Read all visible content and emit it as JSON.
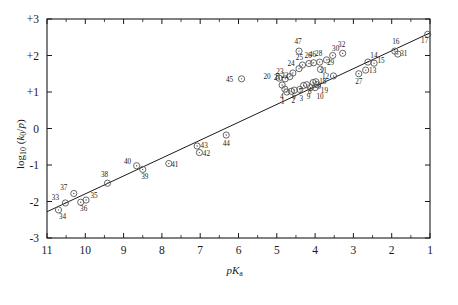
{
  "figure": {
    "background": "#ffffff",
    "ink": "#1a1a1a",
    "marker_color": "#555555"
  },
  "chart_data": {
    "type": "scatter",
    "title": "",
    "subtitle": "",
    "xlabel": "pKa",
    "xlabel_parts": {
      "p": "p",
      "K": "K",
      "sub": "a"
    },
    "ylabel": "log10 (k0/p)",
    "ylabel_parts": {
      "log": "log",
      "logsub": "10",
      "open": " (",
      "k": "k",
      "ksub": "0",
      "slash": "/",
      "p": "p",
      "close": ")"
    },
    "xlim": [
      11,
      1
    ],
    "ylim": [
      -3,
      3
    ],
    "x_reversed": true,
    "grid": false,
    "legend": null,
    "xticks": [
      11,
      10,
      9,
      8,
      7,
      6,
      5,
      4,
      3,
      2,
      1
    ],
    "xticklabels": [
      "11",
      "10",
      "9",
      "8",
      "7",
      "6",
      "5",
      "4",
      "3",
      "2",
      "1"
    ],
    "x_minor_ticks": [
      10.5,
      9.5,
      8.5,
      7.5,
      6.5,
      5.5,
      4.5,
      3.5,
      2.5,
      1.5
    ],
    "yticks": [
      3,
      2,
      1,
      0,
      -1,
      -2,
      -3
    ],
    "yticklabels": [
      "+3",
      "+2",
      "+1",
      "0",
      "-1",
      "-2",
      "-3"
    ],
    "ticks_all_sides": true,
    "fit_line": {
      "label": "",
      "x_start": 11.0,
      "y_start": -2.28,
      "x_end": 1.0,
      "y_end": 2.62,
      "slope": -0.49,
      "intercept": 3.11
    },
    "marker": {
      "shape": "circle-open-with-dot",
      "radius_px": 3.1
    },
    "points": [
      {
        "id": "1",
        "x": 4.74,
        "y": 1.0,
        "lx": -4,
        "ly": 12
      },
      {
        "id": "2",
        "x": 4.62,
        "y": 1.02,
        "lx": 2,
        "ly": 12
      },
      {
        "id": "3",
        "x": 4.54,
        "y": 1.05,
        "lx": 7,
        "ly": 11
      },
      {
        "id": "4",
        "x": 4.79,
        "y": 1.08,
        "lx": -3,
        "ly": 10
      },
      {
        "id": "5",
        "x": 4.86,
        "y": 1.19,
        "lx": -5,
        "ly": -6
      },
      {
        "id": "6",
        "x": 4.4,
        "y": 1.07,
        "lx": -6,
        "ly": 10
      },
      {
        "id": "7",
        "x": 4.3,
        "y": 1.18,
        "lx": -3,
        "ly": 9
      },
      {
        "id": "8",
        "x": 4.22,
        "y": 1.2,
        "lx": 3,
        "ly": 9
      },
      {
        "id": "9",
        "x": 4.12,
        "y": 1.12,
        "lx": -2,
        "ly": 11
      },
      {
        "id": "9b",
        "x": 4.05,
        "y": 1.26,
        "lx": 6,
        "ly": 6
      },
      {
        "id": "10",
        "x": 4.0,
        "y": 1.12,
        "lx": 5,
        "ly": 11
      },
      {
        "id": "11",
        "x": 3.86,
        "y": 1.62,
        "lx": 3,
        "ly": 4
      },
      {
        "id": "12",
        "x": 3.52,
        "y": 1.44,
        "lx": -8,
        "ly": 3
      },
      {
        "id": "13",
        "x": 2.68,
        "y": 1.6,
        "lx": 7,
        "ly": 3
      },
      {
        "id": "14",
        "x": 2.62,
        "y": 1.82,
        "lx": 6,
        "ly": -4
      },
      {
        "id": "15",
        "x": 2.46,
        "y": 1.79,
        "lx": 7,
        "ly": 0
      },
      {
        "id": "16",
        "x": 1.92,
        "y": 2.12,
        "lx": 1,
        "ly": -7
      },
      {
        "id": "17",
        "x": 1.06,
        "y": 2.58,
        "lx": -3,
        "ly": 9
      },
      {
        "id": "18",
        "x": 3.98,
        "y": 1.28,
        "lx": 7,
        "ly": 2
      },
      {
        "id": "19",
        "x": 3.94,
        "y": 1.2,
        "lx": 7,
        "ly": 8
      },
      {
        "id": "20",
        "x": 4.94,
        "y": 1.38,
        "lx": -12,
        "ly": 1
      },
      {
        "id": "21",
        "x": 4.78,
        "y": 1.36,
        "lx": -8,
        "ly": 1
      },
      {
        "id": "22",
        "x": 4.66,
        "y": 1.42,
        "lx": -5,
        "ly": 1
      },
      {
        "id": "23",
        "x": 4.58,
        "y": 1.52,
        "lx": -13,
        "ly": 1
      },
      {
        "id": "24",
        "x": 4.42,
        "y": 1.64,
        "lx": -8,
        "ly": -3
      },
      {
        "id": "25",
        "x": 4.33,
        "y": 1.74,
        "lx": -3,
        "ly": -5
      },
      {
        "id": "26",
        "x": 4.16,
        "y": 1.78,
        "lx": -1,
        "ly": -6
      },
      {
        "id": "27",
        "x": 2.86,
        "y": 1.5,
        "lx": 0,
        "ly": 10
      },
      {
        "id": "28",
        "x": 3.88,
        "y": 1.82,
        "lx": -1,
        "ly": -6
      },
      {
        "id": "29",
        "x": 3.7,
        "y": 1.88,
        "lx": 4,
        "ly": 5
      },
      {
        "id": "30",
        "x": 3.54,
        "y": 2.0,
        "lx": 3,
        "ly": -5
      },
      {
        "id": "31",
        "x": 1.84,
        "y": 2.04,
        "lx": 6,
        "ly": 2
      },
      {
        "id": "32",
        "x": 3.28,
        "y": 2.06,
        "lx": -1,
        "ly": -6
      },
      {
        "id": "33",
        "x": 10.52,
        "y": -2.04,
        "lx": -10,
        "ly": -3
      },
      {
        "id": "34",
        "x": 10.7,
        "y": -2.23,
        "lx": 4,
        "ly": 9
      },
      {
        "id": "35",
        "x": 9.98,
        "y": -1.96,
        "lx": 8,
        "ly": -2
      },
      {
        "id": "36",
        "x": 10.12,
        "y": -2.02,
        "lx": 3,
        "ly": 9
      },
      {
        "id": "37",
        "x": 10.3,
        "y": -1.78,
        "lx": -10,
        "ly": -3
      },
      {
        "id": "38",
        "x": 9.42,
        "y": -1.5,
        "lx": -3,
        "ly": -6
      },
      {
        "id": "39",
        "x": 8.5,
        "y": -1.12,
        "lx": 2,
        "ly": 10
      },
      {
        "id": "40",
        "x": 8.66,
        "y": -1.02,
        "lx": -9,
        "ly": -2
      },
      {
        "id": "41",
        "x": 7.82,
        "y": -0.96,
        "lx": 6,
        "ly": 3
      },
      {
        "id": "42",
        "x": 7.02,
        "y": -0.66,
        "lx": 7,
        "ly": 3
      },
      {
        "id": "43",
        "x": 7.08,
        "y": -0.48,
        "lx": 7,
        "ly": 2
      },
      {
        "id": "44",
        "x": 6.32,
        "y": -0.18,
        "lx": 0,
        "ly": 11
      },
      {
        "id": "45",
        "x": 5.92,
        "y": 1.36,
        "lx": -12,
        "ly": 3
      },
      {
        "id": "46",
        "x": 4.04,
        "y": 1.8,
        "lx": -1,
        "ly": -6
      },
      {
        "id": "47",
        "x": 4.42,
        "y": 2.12,
        "lx": -1,
        "ly": -7
      }
    ]
  },
  "geometry": {
    "plot_left": 47,
    "plot_top": 19,
    "plot_right": 430,
    "plot_bottom": 238
  }
}
